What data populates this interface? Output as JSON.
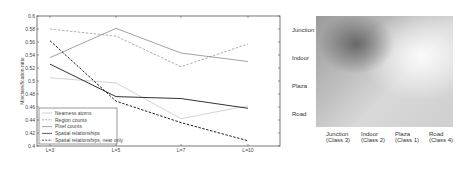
{
  "chart_data": [
    {
      "type": "line",
      "title": "",
      "xlabel": "",
      "ylabel": "Misclassification ratio",
      "categories": [
        "L=3",
        "L=5",
        "L=7",
        "L=10"
      ],
      "ylim": [
        0.4,
        0.6
      ],
      "yticks": [
        "0.4",
        "0.42",
        "0.44",
        "0.46",
        "0.48",
        "0.5",
        "0.52",
        "0.54",
        "0.56",
        "0.58",
        "0.6"
      ],
      "grid": false,
      "legend_position": "lower left",
      "series": [
        {
          "name": "Nearness atoms",
          "style": "solid",
          "color": "#c8c8c8",
          "values": [
            0.505,
            0.497,
            0.442,
            0.462
          ]
        },
        {
          "name": "Region counts",
          "style": "dashed",
          "color": "#9a9a9a",
          "values": [
            0.58,
            0.569,
            0.522,
            0.557
          ]
        },
        {
          "name": "Pixel counts",
          "style": "solid",
          "color": "#8a8a8a",
          "values": [
            0.536,
            0.581,
            0.543,
            0.53
          ]
        },
        {
          "name": "Spatial relationships",
          "style": "solid",
          "color": "#333333",
          "values": [
            0.526,
            0.476,
            0.473,
            0.458
          ]
        },
        {
          "name": "Spatial relationships, near only",
          "style": "dashed",
          "color": "#222222",
          "values": [
            0.562,
            0.469,
            0.436,
            0.408
          ]
        }
      ]
    },
    {
      "type": "heatmap",
      "title": "",
      "row_labels": [
        "Junction",
        "Indoor",
        "Plaza",
        "Road"
      ],
      "col_labels": [
        "Junction (Class 3)",
        "Indoor (Class 2)",
        "Plaza (Class 1)",
        "Road (Class 4)"
      ],
      "note": "grayscale similarity map; darkest region near Junction/Indoor rows x Junction/Indoor columns, lightest at upper right"
    }
  ],
  "heatmap": {
    "rows": [
      "Junction",
      "Indoor",
      "Plaza",
      "Road"
    ],
    "cols": [
      {
        "line1": "Junction",
        "line2": "(Class 3)"
      },
      {
        "line1": "Indoor",
        "line2": "(Class 2)"
      },
      {
        "line1": "Plaza",
        "line2": "(Class 1)"
      },
      {
        "line1": "Road",
        "line2": "(Class 4)"
      }
    ]
  }
}
